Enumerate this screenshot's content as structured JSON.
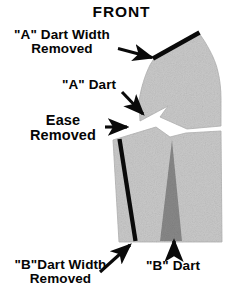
{
  "figure": {
    "title": "FRONT",
    "type": "sewing-pattern-diagram"
  },
  "labels": {
    "a_dart_width_removed": "\"A\" Dart Width\nRemoved",
    "a_dart": "\"A\" Dart",
    "ease_removed": "Ease\nRemoved",
    "b_dart_width_removed": "\"B\"Dart Width\nRemoved",
    "b_dart": "\"B\" Dart"
  },
  "colors": {
    "paper": "#ffffff",
    "pattern_fill": "#c9c9c9",
    "dart_fill": "#888888",
    "ink": "#0a0a0a",
    "outline": "#b0b0b0"
  },
  "annotations": [
    {
      "name": "a-dart-width-removed",
      "target": "shoulder-line",
      "arrow": "right"
    },
    {
      "name": "a-dart",
      "target": "upper-dart-notch",
      "arrow": "down-right"
    },
    {
      "name": "ease-removed",
      "target": "side-seam-line",
      "arrow": "right"
    },
    {
      "name": "b-dart-width-removed",
      "target": "lower-seam-line",
      "arrow": "up-right"
    },
    {
      "name": "b-dart",
      "target": "lower-dart-wedge",
      "arrow": "up"
    }
  ],
  "markings": {
    "shoulder_line": "heavy black line across upper shoulder edge",
    "side_seam_line": "heavy black line down left of lower piece",
    "upper_dart": "white wedge notch cut into lower left of upper piece",
    "lower_dart": "solid gray tapered triangle in lower piece"
  }
}
